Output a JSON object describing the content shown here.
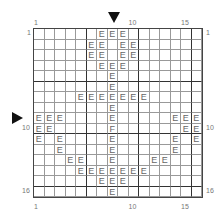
{
  "grid": {
    "cols": 16,
    "rows": 16,
    "cells": {
      "1": {
        "7": "E",
        "8": "E",
        "9": "E"
      },
      "2": {
        "6": "E",
        "7": "E",
        "9": "E",
        "10": "E"
      },
      "3": {
        "6": "E",
        "7": "E",
        "9": "E",
        "10": "E"
      },
      "4": {
        "7": "E",
        "8": "E",
        "9": "E"
      },
      "5": {
        "8": "E"
      },
      "6": {
        "8": "E"
      },
      "7": {
        "5": "E",
        "6": "E",
        "7": "E",
        "8": "E",
        "9": "E",
        "10": "E",
        "11": "E"
      },
      "8": {
        "8": "E"
      },
      "9": {
        "1": "E",
        "2": "E",
        "3": "E",
        "8": "E",
        "14": "E",
        "15": "E",
        "16": "E"
      },
      "10": {
        "1": "E",
        "2": "E",
        "8": "F",
        "15": "E",
        "16": "E"
      },
      "11": {
        "1": "E",
        "3": "E",
        "8": "E",
        "14": "E",
        "16": "E"
      },
      "12": {
        "3": "E",
        "8": "E",
        "14": "E"
      },
      "13": {
        "4": "E",
        "5": "E",
        "8": "E",
        "12": "E",
        "13": "E"
      },
      "14": {
        "5": "E",
        "6": "E",
        "7": "E",
        "8": "E",
        "9": "E",
        "10": "E",
        "11": "E"
      },
      "15": {
        "7": "E",
        "8": "E",
        "9": "E"
      },
      "16": {
        "8": "E"
      }
    }
  },
  "labels": {
    "top": [
      {
        "text": "1",
        "col": 1
      },
      {
        "text": "10",
        "col": 10
      },
      {
        "text": "15",
        "col": 15
      }
    ],
    "bottom": [
      {
        "text": "1",
        "col": 1
      },
      {
        "text": "10",
        "col": 10
      },
      {
        "text": "15",
        "col": 15
      }
    ],
    "left": [
      {
        "text": "1",
        "row": 1
      },
      {
        "text": "10",
        "row": 10
      },
      {
        "text": "16",
        "row": 16
      }
    ],
    "right": [
      {
        "text": "1",
        "row": 1
      },
      {
        "text": "10",
        "row": 10
      },
      {
        "text": "16",
        "row": 16
      }
    ]
  },
  "markers": {
    "top_arrow_col": 8,
    "left_arrow_row": 8
  }
}
